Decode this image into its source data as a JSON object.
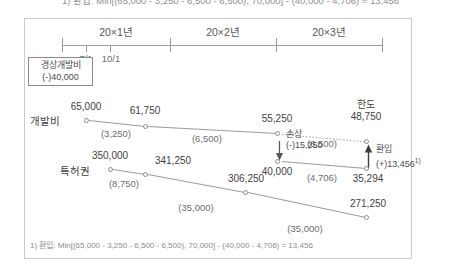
{
  "cut_top_line": "1) 환입: Min[(65,000 - 3,250 - 6,500 - 6,500), 70,000] - (40,000 - 4,706) = 13,456",
  "timeline": {
    "years": [
      {
        "label": "20×1년",
        "left": 62,
        "width": 108
      },
      {
        "label": "20×2년",
        "left": 170,
        "width": 106
      },
      {
        "label": "20×3년",
        "left": 276,
        "width": 106
      }
    ],
    "month_ticks": [
      {
        "label": "7/1",
        "x": 86
      },
      {
        "label": "10/1",
        "x": 110
      }
    ]
  },
  "dev_expense_box": {
    "title": "경상개발비",
    "amount": "(-)40,000"
  },
  "rows": [
    {
      "name": "개발비",
      "label_x": 30,
      "label_y": 113,
      "nodes": [
        {
          "value": "65,000",
          "x": 86,
          "y": 118,
          "label_pos": "above"
        },
        {
          "value": "61,750",
          "x": 145,
          "y": 124,
          "label_pos": "above"
        },
        {
          "value": "55,250",
          "x": 277,
          "y": 131,
          "label_pos": "above"
        },
        {
          "value": "40,000",
          "x": 277,
          "y": 159,
          "label_pos": "below"
        },
        {
          "value": "35,294",
          "x": 366,
          "y": 166,
          "label_pos": "below"
        }
      ],
      "amortizations": [
        {
          "value": "(3,250)",
          "x": 116,
          "y": 128
        },
        {
          "value": "(6,500)",
          "x": 207,
          "y": 133
        },
        {
          "value": "(4,706)",
          "x": 322,
          "y": 172
        }
      ]
    },
    {
      "name": "특허권",
      "label_x": 60,
      "label_y": 163,
      "nodes": [
        {
          "value": "350,000",
          "x": 110,
          "y": 167,
          "label_pos": "above"
        },
        {
          "value": "341,250",
          "x": 145,
          "y": 172,
          "label_pos": "above"
        },
        {
          "value": "306,250",
          "x": 245,
          "y": 190,
          "label_pos": "above"
        },
        {
          "value": "271,250",
          "x": 366,
          "y": 215,
          "label_pos": "above"
        }
      ],
      "amortizations": [
        {
          "value": "(8,750)",
          "x": 124,
          "y": 178
        },
        {
          "value": "(35,000)",
          "x": 196,
          "y": 202
        },
        {
          "value": "(35,000)",
          "x": 305,
          "y": 223
        }
      ]
    }
  ],
  "annotations": {
    "impairment": {
      "title": "손상",
      "amount": "(-)15,250",
      "x": 290,
      "y": 133
    },
    "limit": {
      "title": "한도",
      "value": "48,750",
      "x": 363,
      "y": 101
    },
    "reversal": {
      "title": "환입",
      "amount": "(+)13,456",
      "sup": "1)",
      "x": 379,
      "y": 147
    },
    "dashed_amort": {
      "value": "(6,500)",
      "x": 322,
      "y": 140
    }
  },
  "footnote": "1) 환입: Min[(65,000 - 3,250 - 6,500 - 6,500), 70,000] - (40,000 - 4,706) = 13,456",
  "colors": {
    "frame": "#c8ccd0",
    "axis": "#9b9b9b",
    "line": "#9a9a9a",
    "text": "#4a4a4a",
    "muted": "#6d6d6d"
  }
}
